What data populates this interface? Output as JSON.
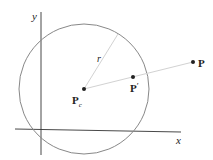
{
  "diagram": {
    "axes": {
      "x_label": "x",
      "y_label": "y"
    },
    "circle": {
      "radius_label": "r"
    },
    "points": {
      "center": {
        "label": "P",
        "subscript": "c"
      },
      "projected": {
        "label": "P",
        "prime": "′"
      },
      "outer": {
        "label": "P"
      }
    },
    "colors": {
      "axis": "#333333",
      "circle": "#888888",
      "guide_line": "#cfcfcf",
      "point": "#222222"
    }
  }
}
